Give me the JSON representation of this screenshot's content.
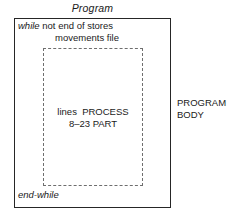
{
  "diagram": {
    "title": "Program",
    "while_header": {
      "keyword": "while",
      "condition_line1": " not end of stores",
      "condition_line2": "movements file"
    },
    "inner_block": {
      "line1": "lines  PROCESS",
      "line2": "8–23 PART"
    },
    "footer": {
      "end_keyword": "end-while"
    },
    "side_annotation": {
      "line1": "PROGRAM",
      "line2": "BODY"
    },
    "colors": {
      "ink": "#1a1a1a",
      "outer_border": "#262626",
      "inner_border_dashed": "#6e6e6e",
      "background": "#ffffff"
    }
  }
}
